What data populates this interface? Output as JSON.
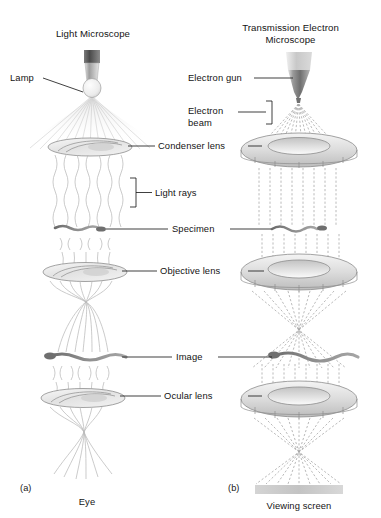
{
  "figure": {
    "type": "scientific-diagram"
  },
  "panels": [
    {
      "id": "a",
      "id_label": "(a)",
      "title": "Light Microscope",
      "source_label": "Lamp",
      "detector_label": "Eye",
      "ray_label": "Light rays",
      "ray_style": "wavy-solid"
    },
    {
      "id": "b",
      "id_label": "(b)",
      "title": "Transmission Electron\nMicroscope",
      "title_line1": "Transmission Electron",
      "title_line2": "Microscope",
      "source_label": "Electron gun",
      "beam_label_line1": "Electron",
      "beam_label_line2": "beam",
      "detector_label": "Viewing screen",
      "ray_style": "dashed-straight"
    }
  ],
  "shared_labels": [
    {
      "name": "condenser-lens",
      "text": "Condenser lens"
    },
    {
      "name": "specimen",
      "text": "Specimen"
    },
    {
      "name": "objective-lens",
      "text": "Objective lens"
    },
    {
      "name": "image",
      "text": "Image"
    },
    {
      "name": "ocular-lens",
      "text": "Ocular lens"
    }
  ],
  "colors": {
    "background": "#ffffff",
    "text": "#141414",
    "leader_line": "#1d1d1d",
    "light_ray": "#b9b9b9",
    "electron_ray": "#a8a8a8",
    "lens_fill": "#e9e9e9",
    "lens_stroke": "#8d8d8d",
    "specimen": "#8e8e8e",
    "screen": "#c9c9c9",
    "gun_dark": "#5a5a5a",
    "gun_light": "#d6d6d6"
  }
}
